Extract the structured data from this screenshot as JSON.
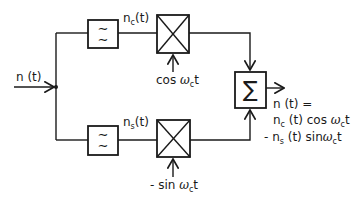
{
  "diagram": {
    "type": "block-diagram",
    "title": "",
    "input": {
      "label": "n (t)"
    },
    "upper_branch": {
      "filter": {
        "label": "lowpass-filter",
        "glyph": "≈"
      },
      "signal_label_main": "n",
      "signal_label_sub": "c",
      "signal_label_arg": "(t)",
      "mixer": {
        "label": "multiplier"
      },
      "carrier_label_pre": "cos ",
      "carrier_label_omega": "ω",
      "carrier_label_sub": "c",
      "carrier_label_post": "t"
    },
    "lower_branch": {
      "filter": {
        "label": "lowpass-filter",
        "glyph": "≈"
      },
      "signal_label_main": "n",
      "signal_label_sub": "s",
      "signal_label_arg": "(t)",
      "mixer": {
        "label": "multiplier"
      },
      "carrier_label_pre": "- sin ",
      "carrier_label_omega": "ω",
      "carrier_label_sub": "c",
      "carrier_label_post": "t"
    },
    "summer": {
      "glyph": "∑"
    },
    "output": {
      "line1": "n (t) =",
      "line2_a": "n",
      "line2_sub": "c",
      "line2_b": " (t) cos ",
      "line2_omega": "ω",
      "line2_sub2": "c",
      "line2_c": "t",
      "line3_a": "- n",
      "line3_sub": "s",
      "line3_b": " (t) sin",
      "line3_omega": "ω",
      "line3_sub2": "c",
      "line3_c": "t"
    },
    "colors": {
      "stroke": "#1a1a1a",
      "background": "#ffffff"
    }
  }
}
